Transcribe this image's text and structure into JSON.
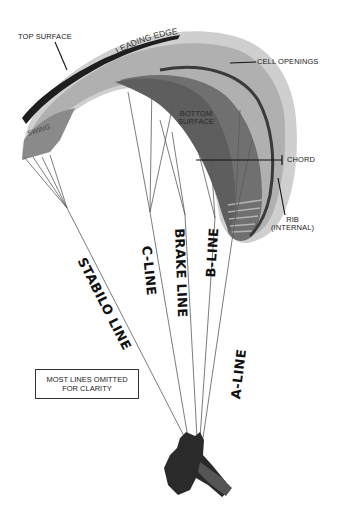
{
  "diagram": {
    "labels": {
      "top_surface": "TOP SURFACE",
      "leading_edge": "LEADING EDGE",
      "cell_openings": "CELL OPENINGS",
      "bottom_surface_line1": "BOTTOM",
      "bottom_surface_line2": "SURFACE",
      "chord": "CHORD",
      "rib_line1": "RIB",
      "rib_line2": "(INTERNAL)",
      "brand": "SWING"
    },
    "line_labels": {
      "stabilo": "STABILO LINE",
      "c_line": "C-LINE",
      "brake": "BRAKE LINE",
      "b_line": "B-LINE",
      "a_line": "A-LINE"
    },
    "note": {
      "line1": "MOST LINES OMITTED",
      "line2": "FOR CLARITY"
    },
    "colors": {
      "canopy_light": "#d4d4d4",
      "canopy_mid": "#a8a8a8",
      "canopy_dark": "#6e6e6e",
      "canopy_underside": "#5a5a5a",
      "stripe": "#222222",
      "lines": "#555555",
      "pilot": "#2a2a2a"
    }
  }
}
